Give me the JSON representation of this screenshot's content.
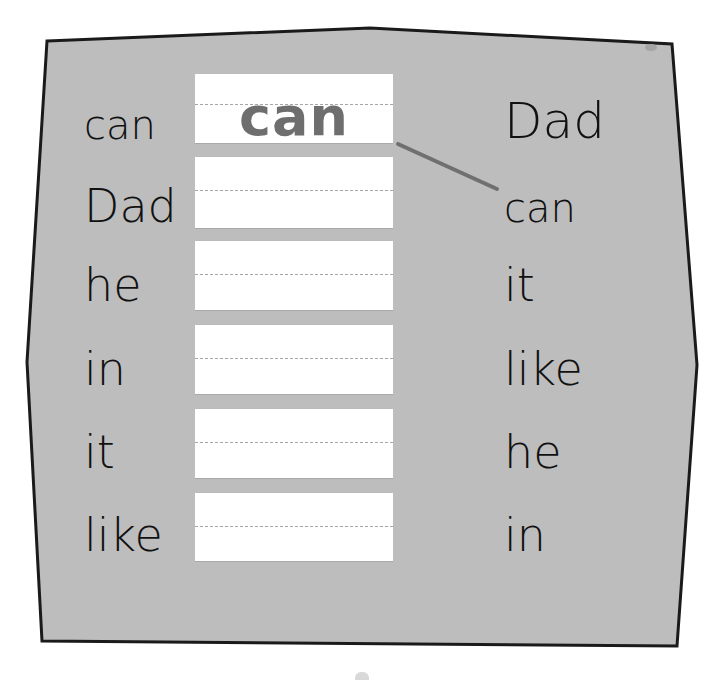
{
  "worksheet": {
    "background_color": "#bdbdbd",
    "border_color": "#1a1a1a",
    "shape_points": "47,41 370,28 672,44 697,365 677,646 42,641 27,362 47,41",
    "left_words": [
      "can",
      "Dad",
      "he",
      "in",
      "it",
      "like"
    ],
    "right_words": [
      "Dad",
      "can",
      "it",
      "like",
      "he",
      "in"
    ],
    "writing_boxes": [
      {
        "value": "can"
      },
      {
        "value": ""
      },
      {
        "value": ""
      },
      {
        "value": ""
      },
      {
        "value": ""
      },
      {
        "value": ""
      }
    ],
    "connector_line": {
      "from_box": 1,
      "to_right_word": "can",
      "x1": 398,
      "y1": 144,
      "x2": 497,
      "y2": 189,
      "color": "#707070"
    },
    "written_text_color": "#6e6e6e"
  }
}
